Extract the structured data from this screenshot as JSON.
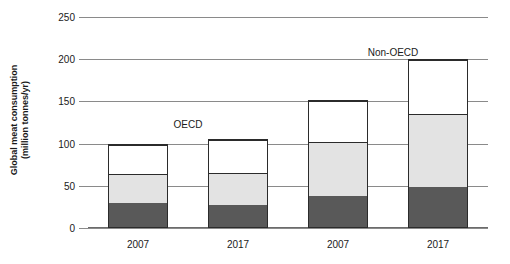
{
  "chart_data": {
    "type": "bar",
    "title": "",
    "subtitle": "",
    "xlabel": "",
    "ylabel": "Global meat consumption (million tonnes/yr)",
    "ylabel_line1": "Global meat consumption",
    "ylabel_line2": "(million tonnes/yr)",
    "categories": [
      "2007",
      "2017",
      "2007",
      "2017"
    ],
    "ylim": [
      0,
      250
    ],
    "yticks": [
      0,
      50,
      100,
      150,
      200,
      250
    ],
    "ytick_labels": [
      "0",
      "50",
      "100",
      "150",
      "200",
      "250"
    ],
    "grid": true,
    "stacked": true,
    "legend": "none",
    "series": [
      {
        "name": "bottom-segment",
        "color": "#595959",
        "values": [
          29,
          27,
          37,
          48
        ]
      },
      {
        "name": "middle-segment",
        "color": "#e3e3e3",
        "values": [
          35,
          38,
          65,
          87
        ]
      },
      {
        "name": "top-segment",
        "color": "#ffffff",
        "values": [
          36,
          40,
          50,
          65
        ]
      }
    ],
    "totals": [
      100,
      105,
      152,
      200
    ],
    "annotations": [
      {
        "text": "OECD",
        "x_value": 1.0,
        "y_value": 122
      },
      {
        "text": "Non-OECD",
        "x_value": 3.05,
        "y_value": 207
      }
    ],
    "groups": [
      {
        "label": "OECD",
        "categories": [
          "2007",
          "2017"
        ]
      },
      {
        "label": "Non-OECD",
        "categories": [
          "2007",
          "2017"
        ]
      }
    ]
  },
  "colors": {
    "bar_outline": "#2b2b2b",
    "gridline": "#8a8a8a",
    "text": "#1a1a1a",
    "background": "#ffffff"
  }
}
